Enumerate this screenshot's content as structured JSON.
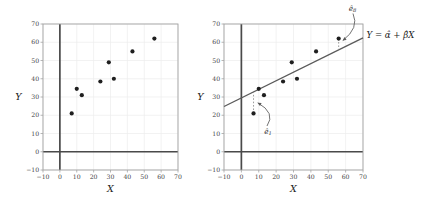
{
  "figure": {
    "x_label": "X",
    "y_label": "Y",
    "equation": "Y = α̂ + β̂X",
    "annotation_e8": {
      "base": "ê",
      "sub": "8"
    },
    "annotation_e1": {
      "base": "ê",
      "sub": "1"
    },
    "colors": {
      "point": "#1f1f1f",
      "fit_line": "#5a5a5a",
      "zero_axis": "#4a4a4a",
      "grid": "#ececec",
      "spine": "#a3a3a3",
      "tick_text": "#3f3f3f",
      "residual_dots": "#8a8a8a"
    }
  },
  "chart_data": [
    {
      "type": "scatter",
      "title": "",
      "xlabel": "X",
      "ylabel": "Y",
      "xlim": [
        -10,
        70
      ],
      "ylim": [
        -10,
        70
      ],
      "xticks": [
        -10,
        0,
        10,
        20,
        30,
        40,
        50,
        60,
        70
      ],
      "yticks": [
        -10,
        0,
        10,
        20,
        30,
        40,
        50,
        60,
        70
      ],
      "grid": true,
      "zero_lines": true,
      "points": [
        [
          7,
          21
        ],
        [
          10,
          34.5
        ],
        [
          13,
          31
        ],
        [
          24,
          38.5
        ],
        [
          29,
          49
        ],
        [
          32,
          40
        ],
        [
          43,
          55
        ],
        [
          56,
          62
        ]
      ]
    },
    {
      "type": "scatter",
      "title": "",
      "xlabel": "X",
      "ylabel": "Y",
      "xlim": [
        -10,
        70
      ],
      "ylim": [
        -10,
        70
      ],
      "xticks": [
        -10,
        0,
        10,
        20,
        30,
        40,
        50,
        60,
        70
      ],
      "yticks": [
        -10,
        0,
        10,
        20,
        30,
        40,
        50,
        60,
        70
      ],
      "grid": true,
      "zero_lines": true,
      "points": [
        [
          7,
          21
        ],
        [
          10,
          34.5
        ],
        [
          13,
          31
        ],
        [
          24,
          38.5
        ],
        [
          29,
          49
        ],
        [
          32,
          40
        ],
        [
          43,
          55
        ],
        [
          56,
          62
        ]
      ],
      "fit_line": {
        "intercept": 29.5,
        "slope": 0.47,
        "label": "Y = α̂ + β̂X"
      },
      "residuals": [
        {
          "label": "ê₁",
          "point_index": 0
        },
        {
          "label": "ê₈",
          "point_index": 7
        }
      ]
    }
  ]
}
